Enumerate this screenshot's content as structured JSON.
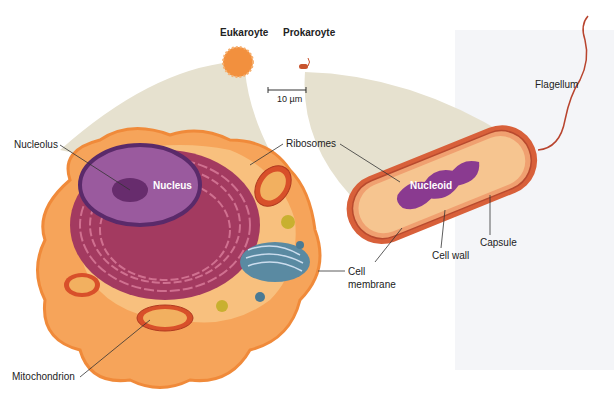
{
  "diagram": {
    "title_eukaryote": "Eukaroyte",
    "title_prokaryote": "Prokaroyte",
    "scale_bar": "10 µm",
    "labels": {
      "nucleolus": "Nucleolus",
      "nucleus": "Nucleus",
      "ribosomes": "Ribosomes",
      "mitochondrion": "Mitochondrion",
      "cell_membrane_line1": "Cell",
      "cell_membrane_line2": "membrane",
      "nucleoid": "Nucleoid",
      "cell_wall": "Cell wall",
      "capsule": "Capsule",
      "flagellum": "Flagellum"
    },
    "colors": {
      "cytoplasm_orange": "#f6a45a",
      "membrane_orange": "#f08a3a",
      "nucleus_purple": "#9a5a9e",
      "er_maroon": "#8a2a4a",
      "golgi_blue": "#4a7a94",
      "zoom_wedge": "#e6e1cf",
      "flagellum_red": "#b8442e"
    }
  }
}
